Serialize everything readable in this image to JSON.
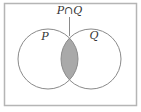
{
  "diagram": {
    "type": "venn",
    "title": "P∩Q",
    "sets": [
      {
        "name": "P"
      },
      {
        "name": "Q"
      }
    ],
    "shaded_region": "P∩Q",
    "colors": {
      "frame": "#b5b5b5",
      "circle_stroke": "#8a8a8a",
      "shade": "#a9a9a9",
      "text": "#333333"
    }
  }
}
